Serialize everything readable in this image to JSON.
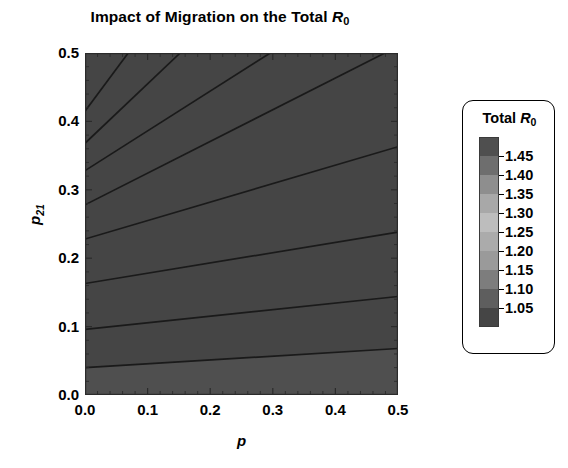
{
  "chart_data": {
    "type": "heatmap",
    "title": "Impact of Migration on the Total R0",
    "title_parts": {
      "lead": "Impact of Migration on the Total ",
      "symbol": "R",
      "symbol_sub": "0"
    },
    "xlabel": "p",
    "ylabel": "p21",
    "ylabel_parts": {
      "symbol": "p",
      "symbol_sub": "21"
    },
    "xlim": [
      0.0,
      0.5
    ],
    "ylim": [
      0.0,
      0.5
    ],
    "xticks": [
      "0.0",
      "0.1",
      "0.2",
      "0.3",
      "0.4",
      "0.5"
    ],
    "xtick_values": [
      0.0,
      0.1,
      0.2,
      0.3,
      0.4,
      0.5
    ],
    "yticks": [
      "0.0",
      "0.1",
      "0.2",
      "0.3",
      "0.4",
      "0.5"
    ],
    "ytick_values": [
      0.0,
      0.1,
      0.2,
      0.3,
      0.4,
      0.5
    ],
    "minor_tick_step": 0.02,
    "grid": false,
    "zlabel": "Total R0",
    "contour_levels": [
      1.05,
      1.1,
      1.15,
      1.2,
      1.25,
      1.3,
      1.35,
      1.4,
      1.45
    ],
    "zlim": [
      1.0,
      1.5
    ],
    "legend_position": "right-outside",
    "colorscale_note": "grayscale, light at mid-range (1.30), dark at both extremes",
    "bands": [
      {
        "range": "1.45-1.50",
        "color": "#4f4f4f"
      },
      {
        "range": "1.40-1.45",
        "color": "#6e6e6e"
      },
      {
        "range": "1.35-1.40",
        "color": "#8e8e8e"
      },
      {
        "range": "1.30-1.35",
        "color": "#a8a8a8"
      },
      {
        "range": "1.25-1.30",
        "color": "#bdbdbd"
      },
      {
        "range": "1.20-1.25",
        "color": "#ababab"
      },
      {
        "range": "1.15-1.20",
        "color": "#9a9a9a"
      },
      {
        "range": "1.10-1.15",
        "color": "#7d7d7d"
      },
      {
        "range": "1.05-1.10",
        "color": "#5e5e5e"
      },
      {
        "range": "1.00-1.05",
        "color": "#454545"
      }
    ],
    "contour_lines": [
      {
        "level": 1.45,
        "x1": 0.0,
        "y1": 0.5,
        "x2": 0.016,
        "y2": 0.5
      },
      {
        "level": 1.4,
        "x1": 0.0,
        "y1": 0.415,
        "x2": 0.069,
        "y2": 0.5
      },
      {
        "level": 1.35,
        "x1": 0.0,
        "y1": 0.368,
        "x2": 0.152,
        "y2": 0.5
      },
      {
        "level": 1.3,
        "x1": 0.0,
        "y1": 0.328,
        "x2": 0.296,
        "y2": 0.5
      },
      {
        "level": 1.25,
        "x1": 0.0,
        "y1": 0.278,
        "x2": 0.479,
        "y2": 0.5
      },
      {
        "level": 1.2,
        "x1": 0.0,
        "y1": 0.228,
        "x2": 0.5,
        "y2": 0.363
      },
      {
        "level": 1.15,
        "x1": 0.0,
        "y1": 0.163,
        "x2": 0.5,
        "y2": 0.238
      },
      {
        "level": 1.1,
        "x1": 0.0,
        "y1": 0.096,
        "x2": 0.5,
        "y2": 0.144
      },
      {
        "level": 1.05,
        "x1": 0.0,
        "y1": 0.04,
        "x2": 0.5,
        "y2": 0.068
      }
    ],
    "legend_entries": [
      {
        "label": "1.45",
        "value": 1.45
      },
      {
        "label": "1.40",
        "value": 1.4
      },
      {
        "label": "1.35",
        "value": 1.35
      },
      {
        "label": "1.30",
        "value": 1.3
      },
      {
        "label": "1.25",
        "value": 1.25
      },
      {
        "label": "1.20",
        "value": 1.2
      },
      {
        "label": "1.15",
        "value": 1.15
      },
      {
        "label": "1.10",
        "value": 1.1
      },
      {
        "label": "1.05",
        "value": 1.05
      }
    ]
  },
  "colors": {
    "background": "#ffffff",
    "foreground": "#000000",
    "frame": "#2b2b2b",
    "contour_line": "#1a1a1a"
  }
}
